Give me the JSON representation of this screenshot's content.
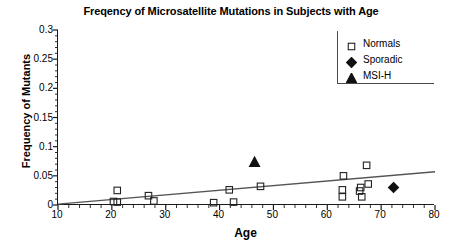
{
  "chart_data": {
    "type": "scatter",
    "title": "Freqency of Microsatellite Mutations in Subjects with Age",
    "xlabel": "Age",
    "ylabel": "Frequency of Mutants",
    "xlim": [
      10,
      80
    ],
    "ylim": [
      0,
      0.3
    ],
    "xticks": [
      10,
      20,
      30,
      40,
      50,
      60,
      70,
      80
    ],
    "xtick_labels": [
      "10",
      "20",
      "30",
      "40",
      "50",
      "60",
      "70",
      "80"
    ],
    "yticks": [
      0,
      0.05,
      0.1,
      0.15,
      0.2,
      0.25,
      0.3
    ],
    "ytick_labels": [
      "0",
      "0.05",
      "0.1",
      "0.15",
      "0.2",
      "0.25",
      "0.3"
    ],
    "x_minor_ticks_per_interval": 5,
    "y_minor_ticks_per_interval": 5,
    "grid": false,
    "legend_position": "top-right",
    "series": [
      {
        "name": "Normals",
        "marker": "square",
        "fill": "open",
        "color": "#222222",
        "points": [
          {
            "x": 20.3,
            "y": 0.006
          },
          {
            "x": 21.0,
            "y": 0.005
          },
          {
            "x": 21.0,
            "y": 0.025
          },
          {
            "x": 26.8,
            "y": 0.016
          },
          {
            "x": 27.8,
            "y": 0.007
          },
          {
            "x": 38.9,
            "y": 0.004
          },
          {
            "x": 42.6,
            "y": 0.005
          },
          {
            "x": 41.8,
            "y": 0.026
          },
          {
            "x": 47.6,
            "y": 0.032
          },
          {
            "x": 62.8,
            "y": 0.026
          },
          {
            "x": 63.0,
            "y": 0.05
          },
          {
            "x": 62.8,
            "y": 0.014
          },
          {
            "x": 66.0,
            "y": 0.024
          },
          {
            "x": 66.2,
            "y": 0.03
          },
          {
            "x": 66.4,
            "y": 0.014
          },
          {
            "x": 67.3,
            "y": 0.068
          },
          {
            "x": 67.6,
            "y": 0.036
          }
        ]
      },
      {
        "name": "Sporadic",
        "marker": "diamond",
        "fill": "solid",
        "color": "#111111",
        "points": [
          {
            "x": 72.3,
            "y": 0.03
          }
        ]
      },
      {
        "name": "MSI-H",
        "marker": "triangle",
        "fill": "solid",
        "color": "#111111",
        "points": [
          {
            "x": 46.5,
            "y": 0.073
          }
        ]
      }
    ],
    "trendline": {
      "x_start": 10,
      "y_start": 0.0015,
      "x_end": 80,
      "y_end": 0.057,
      "color": "#555555"
    },
    "legend_entries": [
      {
        "label": "Normals",
        "marker": "square"
      },
      {
        "label": "Sporadic",
        "marker": "diamond"
      },
      {
        "label": "MSI-H",
        "marker": "triangle"
      }
    ]
  }
}
